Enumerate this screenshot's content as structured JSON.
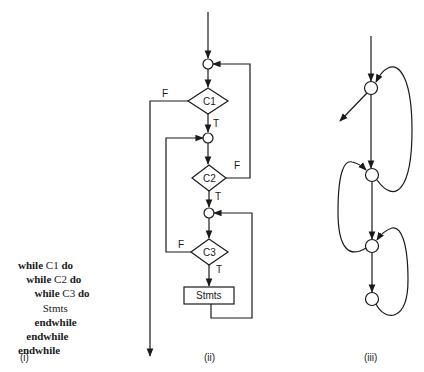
{
  "panel_i": {
    "label": "(i)",
    "code_lines": [
      {
        "indent": "",
        "parts": [
          {
            "t": "while",
            "kw": true
          },
          {
            "t": " C1 ",
            "kw": false
          },
          {
            "t": "do",
            "kw": true
          }
        ]
      },
      {
        "indent": "   ",
        "parts": [
          {
            "t": "while",
            "kw": true
          },
          {
            "t": " C2 ",
            "kw": false
          },
          {
            "t": "do",
            "kw": true
          }
        ]
      },
      {
        "indent": "      ",
        "parts": [
          {
            "t": "while",
            "kw": true
          },
          {
            "t": " C3 ",
            "kw": false
          },
          {
            "t": "do",
            "kw": true
          }
        ]
      },
      {
        "indent": "         ",
        "parts": [
          {
            "t": "Stmts",
            "kw": false
          }
        ]
      },
      {
        "indent": "      ",
        "parts": [
          {
            "t": "endwhile",
            "kw": true
          }
        ]
      },
      {
        "indent": "   ",
        "parts": [
          {
            "t": "endwhile",
            "kw": true
          }
        ]
      },
      {
        "indent": "",
        "parts": [
          {
            "t": "endwhile",
            "kw": true
          }
        ]
      }
    ]
  },
  "panel_ii": {
    "label": "(ii)",
    "decisions": [
      {
        "id": "C1",
        "label": "C1",
        "true_label": "T",
        "false_label": "F"
      },
      {
        "id": "C2",
        "label": "C2",
        "true_label": "T",
        "false_label": "F"
      },
      {
        "id": "C3",
        "label": "C3",
        "true_label": "T",
        "false_label": "F"
      }
    ],
    "process": {
      "label": "Stmts"
    }
  },
  "panel_iii": {
    "label": "(iii)",
    "node_count": 4
  },
  "colors": {
    "ink": "#1a1a1a",
    "background": "#ffffff"
  }
}
